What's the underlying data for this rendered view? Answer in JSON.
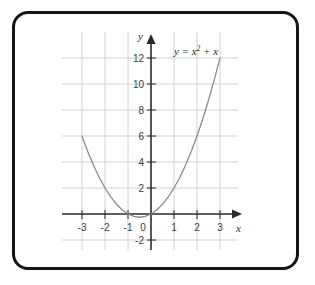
{
  "figure": {
    "border_color": "#151515",
    "background_color": "#ffffff"
  },
  "axes": {
    "x_axis_label": "x",
    "y_axis_label": "y",
    "axis_color": "#2a2a2a",
    "grid_color": "#d2d2d2",
    "origin_label": "0",
    "x_tick_labels": [
      "-3",
      "-2",
      "-1",
      "1",
      "2",
      "3"
    ],
    "y_tick_labels": [
      "12",
      "10",
      "8",
      "6",
      "4",
      "2",
      "-2"
    ]
  },
  "curve": {
    "equation_base": "y = x",
    "equation_exponent": "2",
    "equation_tail": " + x",
    "color": "#8c8c8c"
  },
  "chart_data": {
    "type": "line",
    "title": "",
    "subtitle": "",
    "xlabel": "x",
    "ylabel": "y",
    "annotations": [
      "y = x² + x"
    ],
    "legend": [],
    "legend_position": "none",
    "grid": true,
    "xlim": [
      -3.4,
      3.4
    ],
    "ylim": [
      -2.6,
      13.2
    ],
    "xticks": [
      -3,
      -2,
      -1,
      0,
      1,
      2,
      3
    ],
    "yticks": [
      -2,
      2,
      4,
      6,
      8,
      10,
      12
    ],
    "series": [
      {
        "name": "y = x^2 + x",
        "expression": "y = x^2 + x",
        "color": "#8c8c8c",
        "x": [
          -3,
          -2.75,
          -2.5,
          -2.25,
          -2,
          -1.75,
          -1.5,
          -1.25,
          -1,
          -0.75,
          -0.5,
          -0.25,
          0,
          0.25,
          0.5,
          0.75,
          1,
          1.25,
          1.5,
          1.75,
          2,
          2.25,
          2.5,
          2.75,
          3
        ],
        "y": [
          6,
          4.8125,
          3.75,
          2.8125,
          2,
          1.3125,
          0.75,
          0.3125,
          0,
          -0.1875,
          -0.25,
          -0.1875,
          0,
          0.3125,
          0.75,
          1.3125,
          2,
          2.8125,
          3.75,
          4.8125,
          6,
          7.3125,
          8.75,
          10.3125,
          12
        ]
      }
    ],
    "key_points": {
      "vertex": [
        -0.5,
        -0.25
      ],
      "roots": [
        -1,
        0
      ],
      "endpoints": [
        [
          -3,
          6
        ],
        [
          3,
          12
        ]
      ]
    }
  }
}
